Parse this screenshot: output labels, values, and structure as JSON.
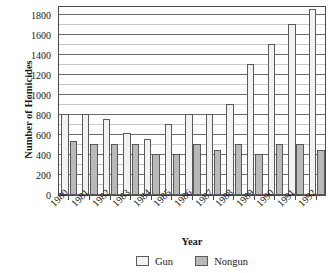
{
  "chart_data": {
    "type": "bar",
    "title": "",
    "xlabel": "Year",
    "ylabel": "Number of Homicides",
    "categories": [
      "1980",
      "1981",
      "1982",
      "1983",
      "1984",
      "1985",
      "1986",
      "1987",
      "1988",
      "1989",
      "1990",
      "1991",
      "1992"
    ],
    "series": [
      {
        "name": "Gun",
        "color": "#f2f2f2",
        "values": [
          810,
          810,
          760,
          620,
          560,
          715,
          815,
          815,
          910,
          1310,
          1510,
          1710,
          1860
        ]
      },
      {
        "name": "Nongun",
        "color": "#b9b9b9",
        "values": [
          545,
          510,
          515,
          510,
          410,
          410,
          515,
          450,
          515,
          410,
          515,
          515,
          450
        ]
      }
    ],
    "ylim": [
      0,
      1900
    ],
    "ytick_values": [
      0,
      200,
      400,
      600,
      800,
      1000,
      1200,
      1400,
      1600,
      1800
    ],
    "ytick_labels": [
      "0",
      "200",
      "400",
      "600",
      "800",
      "1000",
      "1200",
      "1400",
      "1600",
      "1800"
    ],
    "yminor_step": 100,
    "grid": "horizontal",
    "legend_position": "bottom-center",
    "legend_entries": [
      "Gun",
      "Nongun"
    ]
  }
}
